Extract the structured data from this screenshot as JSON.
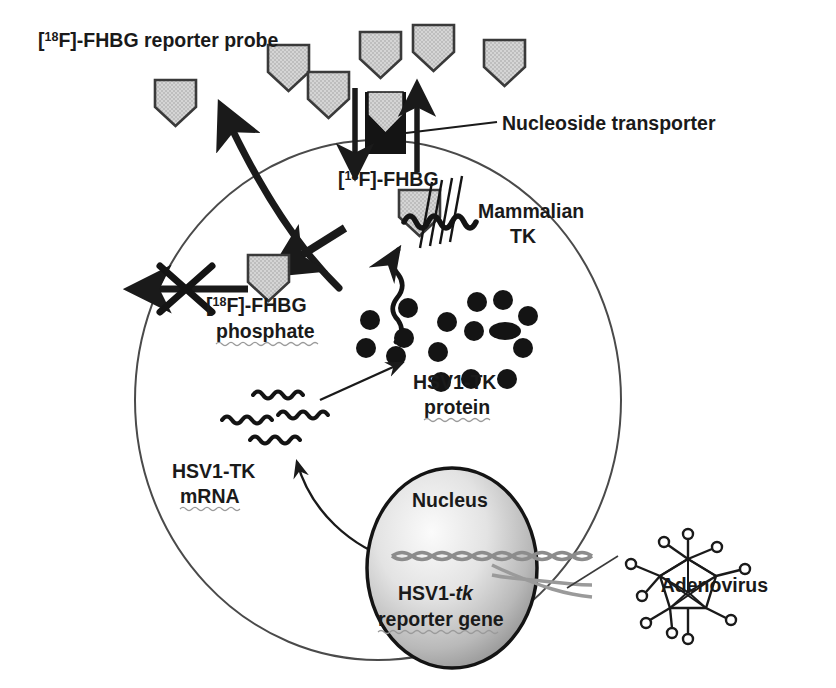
{
  "figure": {
    "background_color": "#ffffff"
  },
  "labels": {
    "probe": {
      "prefix": "[",
      "sup": "18",
      "rest": "F]-FHBG reporter probe",
      "full": "[18F]-FHBG reporter probe"
    },
    "nucleoside_transporter": "Nucleoside transporter",
    "fhbg_inside": {
      "prefix": "[",
      "sup": "18",
      "rest": "F]-FHBG",
      "full": "[18F]-FHBG"
    },
    "mammalian_tk_line1": "Mammalian",
    "mammalian_tk_line2": "TK",
    "fhbg_phosphate_line1": {
      "prefix": "[",
      "sup": "18",
      "rest": "F]-FHBG",
      "full": "[18F]-FHBG"
    },
    "fhbg_phosphate_line2": "phosphate",
    "hsv1_tk_protein_line1": "HSV1-TK",
    "hsv1_tk_protein_line2": "protein",
    "hsv1_tk_mrna_line1": "HSV1-TK",
    "hsv1_tk_mrna_line2": "mRNA",
    "nucleus": "Nucleus",
    "reporter_gene_line1_a": "HSV1-",
    "reporter_gene_line1_b": "tk",
    "reporter_gene_line2": "reporter gene",
    "adenovirus": "Adenovirus"
  },
  "colors": {
    "outline": "#1a1a1a",
    "probe_fill": "#c9c9c9",
    "probe_stroke": "#3a3a3a",
    "transporter_dark": "#1a1a1a",
    "cell_membrane": "#4a4a4a",
    "nucleus_center": "#f2f2f2",
    "nucleus_edge": "#8e8e8e",
    "dna_gray": "#8c8c8c",
    "protein_dot": "#141414",
    "text": "#1a1a1a",
    "spellcheck_squiggle": "#9a9a9a"
  },
  "geometry": {
    "cell": {
      "cx": 378,
      "cy": 400,
      "rx": 243,
      "ry": 260
    },
    "nucleus": {
      "cx": 452,
      "cy": 568,
      "rx": 85,
      "ry": 100
    }
  },
  "elements": {
    "extracellular_probes": [
      {
        "id": "probe-1",
        "x": 155,
        "y": 80
      },
      {
        "id": "probe-2",
        "x": 268,
        "y": 45
      },
      {
        "id": "probe-3",
        "x": 308,
        "y": 72
      },
      {
        "id": "probe-4",
        "x": 360,
        "y": 32
      },
      {
        "id": "probe-5",
        "x": 413,
        "y": 25
      },
      {
        "id": "probe-6",
        "x": 484,
        "y": 40
      }
    ],
    "transporter": {
      "x": 365,
      "y": 92,
      "width": 41,
      "height": 62
    },
    "transporter_probe_inside": {
      "x": 368,
      "y": 92
    },
    "influx_arrow": {
      "x": 417,
      "y": 88,
      "direction": "up"
    },
    "efflux_arrow": {
      "x": 355,
      "y": 88,
      "direction": "down"
    },
    "intracellular_probe": {
      "x": 399,
      "y": 188
    },
    "phosphate_probe": {
      "x": 250,
      "y": 255
    },
    "protein_dots_count": 16,
    "mrna_squiggles_count": 4,
    "blocked_efflux": {
      "cross_x": 183,
      "cross_y": 288
    }
  }
}
